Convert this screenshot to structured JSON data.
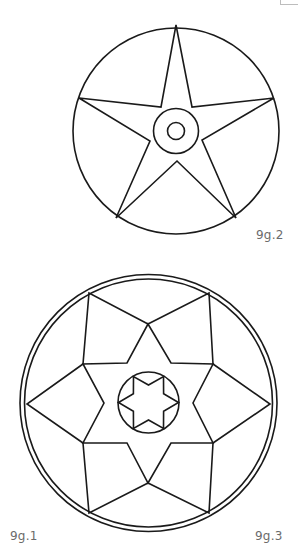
{
  "figures": [
    {
      "id": "fig2",
      "label": "9g.2",
      "description": "five-pointed star inscribed in circle with two concentric center circles",
      "outer_circle": {
        "cx": 176,
        "cy": 131,
        "r": 103
      },
      "center_circle": {
        "cx": 176,
        "cy": 131,
        "r": 22.5
      },
      "dot_circle": {
        "cx": 176,
        "cy": 131,
        "r": 8.5
      },
      "star_points": "176,25 192,107 274,98 202,140 236,218 177,161 116,218 150,141 79,98 161,107"
    },
    {
      "id": "fig3",
      "label": "9g.3",
      "description": "six-pointed star with surrounding kites inside double circle, small hexagram in center circle",
      "outer_circle": {
        "cx": 148.5,
        "cy": 403,
        "r": 128.5
      },
      "inner_circle": {
        "cx": 148.5,
        "cy": 403,
        "r": 124
      },
      "center_circle": {
        "cx": 148.5,
        "cy": 402.5,
        "r": 30.5
      },
      "star_points": "148,324 171,363 213,364 193,403 213,443 171,443 148,483 127,443 83,443 104,403 83,364 127,363",
      "kites": [
        "83,364 89,293 148,324",
        "148,324 209,293 213,364",
        "213,364 270,404 213,443",
        "213,443 209,513 148,483",
        "148,483 89,513 83,443",
        "83,443 27,404 83,364"
      ],
      "small_star_points": "178.5,402.5 163.6,393.8 163.5,376.5 148.5,385 133.5,376.5 133.4,393.8 118.5,402.5 133.4,411.2 133.5,428.5 148.5,420 163.5,428.5 163.6,411.2"
    }
  ],
  "labels": {
    "fig1": "9g.1",
    "fig2": "9g.2",
    "fig3": "9g.3"
  },
  "colors": {
    "stroke": "#1a1a1a",
    "label": "#6b6b6b",
    "background": "#ffffff"
  }
}
